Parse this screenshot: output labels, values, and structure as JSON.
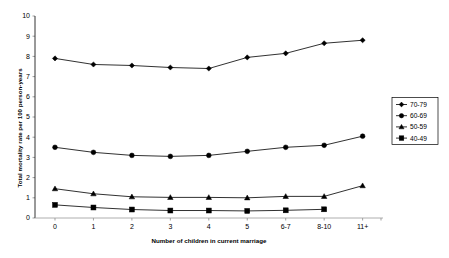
{
  "chart_data": {
    "type": "line",
    "title": "",
    "xlabel": "Number of children in current marriage",
    "ylabel": "Total mortality rate per 100 person-years",
    "categories": [
      "0",
      "1",
      "2",
      "3",
      "4",
      "5",
      "6-7",
      "8-10",
      "11+"
    ],
    "ylim": [
      0,
      10
    ],
    "yticks": [
      "0",
      "1",
      "2",
      "3",
      "4",
      "5",
      "6",
      "7",
      "8",
      "9",
      "10"
    ],
    "grid": false,
    "legend_position": "right",
    "series": [
      {
        "name": "70-79",
        "marker": "diamond",
        "values": [
          7.9,
          7.6,
          7.55,
          7.45,
          7.4,
          7.95,
          8.15,
          8.65,
          8.8
        ]
      },
      {
        "name": "60-69",
        "marker": "circle",
        "values": [
          3.5,
          3.25,
          3.1,
          3.05,
          3.1,
          3.3,
          3.5,
          3.6,
          4.05
        ]
      },
      {
        "name": "50-59",
        "marker": "triangle",
        "values": [
          1.45,
          1.2,
          1.05,
          1.02,
          1.02,
          1.0,
          1.07,
          1.07,
          1.6
        ]
      },
      {
        "name": "40-49",
        "marker": "square",
        "values": [
          0.65,
          0.52,
          0.42,
          0.37,
          0.37,
          0.35,
          0.38,
          0.43,
          null
        ]
      }
    ]
  },
  "legend": {
    "entries": [
      {
        "label": "70-79"
      },
      {
        "label": "60-69"
      },
      {
        "label": "50-59"
      },
      {
        "label": "40-49"
      }
    ]
  },
  "colors": {
    "line": "#1a1a1a",
    "marker": "#000000",
    "axis": "#000000",
    "background": "#ffffff"
  }
}
